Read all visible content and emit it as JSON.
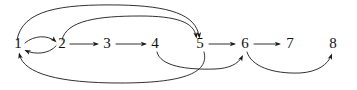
{
  "diagram": {
    "type": "directed-graph",
    "canvas": {
      "width": 357,
      "height": 90
    },
    "style": {
      "background_color": "#ffffff",
      "edge_color": "#1a1a1a",
      "node_label_color": "#111111",
      "node_font_size": 15,
      "edge_stroke_width": 0.9
    },
    "nodes": [
      {
        "id": "1",
        "label": "1",
        "x": 18,
        "y": 48
      },
      {
        "id": "2",
        "label": "2",
        "x": 62,
        "y": 48
      },
      {
        "id": "3",
        "label": "3",
        "x": 107,
        "y": 48
      },
      {
        "id": "4",
        "label": "4",
        "x": 155,
        "y": 48
      },
      {
        "id": "5",
        "label": "5",
        "x": 200,
        "y": 48
      },
      {
        "id": "6",
        "label": "6",
        "x": 245,
        "y": 48
      },
      {
        "id": "7",
        "label": "7",
        "x": 290,
        "y": 48
      },
      {
        "id": "8",
        "label": "8",
        "x": 333,
        "y": 48
      }
    ],
    "edges": [
      {
        "id": "e-1-2",
        "from": "1",
        "to": "2",
        "shape": "arc-up",
        "path": "M 25 43 C 34 35, 48 35, 55 41",
        "arrow": {
          "x": 56.5,
          "y": 42.2,
          "angle": 42
        }
      },
      {
        "id": "e-2-1",
        "from": "2",
        "to": "1",
        "shape": "arc-down",
        "path": "M 56 46 C 49 54, 35 55, 25.5 50.5",
        "arrow": {
          "x": 24.5,
          "y": 50,
          "angle": 205
        }
      },
      {
        "id": "e-2-3",
        "from": "2",
        "to": "3",
        "shape": "straight",
        "path": "M 70 44 L 97 44",
        "arrow": {
          "x": 99,
          "y": 44,
          "angle": 0
        }
      },
      {
        "id": "e-3-4",
        "from": "3",
        "to": "4",
        "shape": "straight",
        "path": "M 116 44 L 145 44",
        "arrow": {
          "x": 147,
          "y": 44,
          "angle": 0
        }
      },
      {
        "id": "e-5-6",
        "from": "5",
        "to": "6",
        "shape": "straight",
        "path": "M 209 44 L 234 44",
        "arrow": {
          "x": 236,
          "y": 44,
          "angle": 0
        }
      },
      {
        "id": "e-6-7",
        "from": "6",
        "to": "7",
        "shape": "straight",
        "path": "M 254 44 L 279 44",
        "arrow": {
          "x": 281,
          "y": 44,
          "angle": 0
        }
      },
      {
        "id": "e-1-5",
        "from": "1",
        "to": "5",
        "shape": "arc-over-outer",
        "path": "M 17 40 C 22 10, 60 4, 120 5 C 168 6, 196 14, 199 36",
        "arrow": {
          "x": 199.5,
          "y": 38.5,
          "angle": 84
        }
      },
      {
        "id": "e-2-5",
        "from": "2",
        "to": "5",
        "shape": "arc-over-inner",
        "path": "M 62 40 C 66 20, 100 16, 140 16 C 176 16, 194 22, 196 36",
        "arrow": {
          "x": 196.5,
          "y": 38.5,
          "angle": 82
        }
      },
      {
        "id": "e-5-1",
        "from": "5",
        "to": "1",
        "shape": "arc-under-long",
        "path": "M 204 52 C 210 74, 180 83, 120 83 C 60 83, 24 74, 19.5 55",
        "arrow": {
          "x": 19,
          "y": 52.5,
          "angle": 256
        }
      },
      {
        "id": "e-4-6",
        "from": "4",
        "to": "6",
        "shape": "arc-under",
        "path": "M 157 52 C 160 66, 186 70, 215 69 C 229 68.5, 238 64, 242 57",
        "arrow": {
          "x": 243,
          "y": 55,
          "angle": 298
        }
      },
      {
        "id": "e-6-8",
        "from": "6",
        "to": "8",
        "shape": "arc-under",
        "path": "M 247 52 C 251 66, 272 74, 300 73 C 318 72, 328 64, 331 56",
        "arrow": {
          "x": 332,
          "y": 53.5,
          "angle": 290
        }
      }
    ],
    "edge_list_text": [
      "1 -> 2",
      "2 -> 1",
      "2 -> 3",
      "3 -> 4",
      "1 -> 5",
      "2 -> 5",
      "5 -> 1",
      "5 -> 6",
      "4 -> 6",
      "6 -> 7",
      "6 -> 8"
    ]
  }
}
